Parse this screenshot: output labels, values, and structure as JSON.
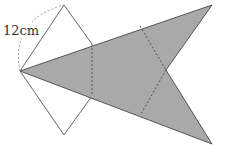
{
  "diagram": {
    "label": "12cm",
    "colors": {
      "fill": "#a9a9a9",
      "stroke": "#555555",
      "dashed": "#666666",
      "arc": "#999999",
      "background": "#ffffff"
    },
    "points": {
      "left": [
        20,
        71
      ],
      "diamond_top": [
        64,
        5
      ],
      "diamond_bottom": [
        64,
        135
      ],
      "diamond_right_top": [
        92,
        44
      ],
      "diamond_right_bottom": [
        92,
        96
      ],
      "tip_top": [
        212,
        5
      ],
      "notch": [
        166,
        70
      ],
      "tip_bottom": [
        212,
        144
      ]
    }
  }
}
